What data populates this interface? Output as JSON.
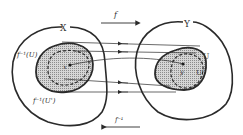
{
  "diagram": {
    "type": "function-preimage-mapping",
    "colors": {
      "stroke": "#2a2a2a",
      "shade": "#b8b8b8",
      "background": "#ffffff"
    },
    "sets": {
      "domain_label": "X",
      "codomain_label": "Y",
      "preimage_U_label": "f⁻¹(U)",
      "preimage_U_prime_label": "f⁻¹(U')",
      "U_label": "U",
      "U_prime_label": "U'",
      "point_x_label": "x",
      "point_y_label": "y"
    },
    "arrows": {
      "forward_label": "f",
      "inverse_label": "f⁻¹"
    }
  }
}
